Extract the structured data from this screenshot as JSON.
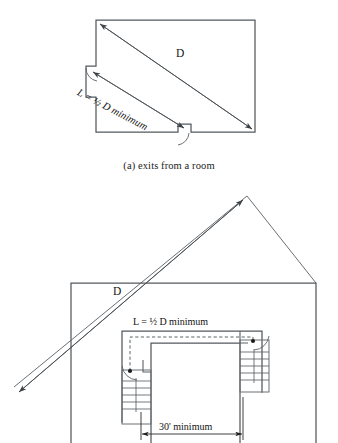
{
  "document": {
    "title": "Exit access travel distance diagrams"
  },
  "colors": {
    "background": "#ffffff",
    "wall_stroke": "#555a5e",
    "thin_stroke": "#6b7075",
    "annotation_stroke": "#4a4f53",
    "text": "#111111"
  },
  "figures": [
    {
      "id": "figure-a",
      "caption": "(a) exits from a room",
      "labels": {
        "diagonal": "D",
        "separation": "L = ½ D minimum"
      },
      "geometry": {
        "room_outline": "96,20 255,20 255,132 191,132 191,124 178,124 178,132 96,132 96,97 86,97 86,66 96,66",
        "diagonal_from": [
          100,
          24
        ],
        "diagonal_to": [
          252,
          129
        ],
        "separation_from": [
          92,
          71
        ],
        "separation_to": [
          184,
          128
        ],
        "doors": [
          {
            "name": "left-door",
            "hinge": [
              96,
              66
            ],
            "swing": "down-right"
          },
          {
            "name": "bottom-door",
            "hinge": [
              191,
              132
            ],
            "swing": "left-down"
          }
        ]
      }
    },
    {
      "id": "figure-b",
      "caption": "",
      "labels": {
        "diagonal": "D",
        "separation": "L = ½ D minimum",
        "corridor_width": "30' minimum"
      },
      "geometry": {
        "building_outline": "71,283 316,283 316,443 71,443",
        "roof_peak": [
          247,
          196
        ],
        "roof_left_end": [
          14,
          387
        ],
        "roof_right_end": [
          316,
          283
        ],
        "diagonal_from": [
          19,
          392
        ],
        "diagonal_to": [
          243,
          200
        ],
        "corridor_outer": "122,331 262,331 262,390 243,390 243,343 141,343 141,422 122,422",
        "dashed_path_from": [
          130,
          371
        ],
        "dashed_path_to": [
          253,
          341
        ],
        "stairs": [
          {
            "name": "left-stair",
            "rect": [
              122,
              370,
              29,
              54
            ],
            "treads": 5,
            "door_hinge": [
              130,
              371
            ]
          },
          {
            "name": "right-stair",
            "rect": [
              240,
              340,
              29,
              52
            ],
            "treads": 5,
            "door_hinge": [
              253,
              341
            ]
          }
        ],
        "dimension": {
          "label": "30' minimum",
          "from": [
            141,
            434
          ],
          "to": [
            243,
            434
          ]
        }
      }
    }
  ]
}
